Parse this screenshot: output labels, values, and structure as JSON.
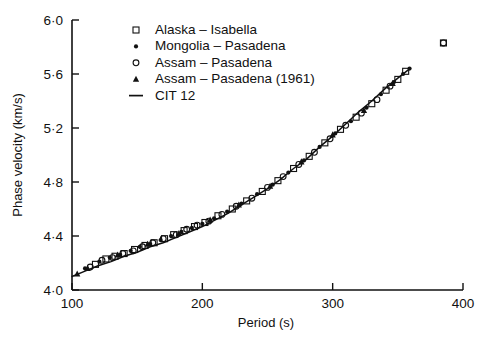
{
  "chart_data": {
    "type": "scatter",
    "title": "",
    "xlabel": "Period (s)",
    "ylabel": "Phase velocity (km/s)",
    "xlim": [
      100,
      400
    ],
    "ylim": [
      4.0,
      6.0
    ],
    "xticks": [
      100,
      200,
      300,
      400
    ],
    "xtick_labels": [
      "100",
      "200",
      "300",
      "400"
    ],
    "yticks": [
      4.0,
      4.4,
      4.8,
      5.2,
      5.6,
      6.0
    ],
    "ytick_labels": [
      "4·0",
      "4·4",
      "4·8",
      "5·2",
      "5·6",
      "6·0"
    ],
    "grid": false,
    "legend_position": "upper-left-inside",
    "legend": [
      {
        "label": "Alaska – Isabella",
        "marker": "open-square"
      },
      {
        "label": "Mongolia – Pasadena",
        "marker": "filled-dot"
      },
      {
        "label": "Assam – Pasadena",
        "marker": "open-circle"
      },
      {
        "label": "Assam – Pasadena (1961)",
        "marker": "filled-triangle"
      },
      {
        "label": "CIT 12",
        "marker": "line"
      }
    ],
    "series": [
      {
        "name": "Alaska – Isabella",
        "marker": "open-square",
        "points": [
          [
            118,
            4.19
          ],
          [
            126,
            4.23
          ],
          [
            133,
            4.25
          ],
          [
            140,
            4.27
          ],
          [
            148,
            4.3
          ],
          [
            156,
            4.33
          ],
          [
            163,
            4.35
          ],
          [
            171,
            4.38
          ],
          [
            178,
            4.41
          ],
          [
            186,
            4.44
          ],
          [
            194,
            4.47
          ],
          [
            202,
            4.5
          ],
          [
            212,
            4.55
          ],
          [
            223,
            4.6
          ],
          [
            234,
            4.66
          ],
          [
            246,
            4.73
          ],
          [
            258,
            4.81
          ],
          [
            270,
            4.9
          ],
          [
            282,
            4.99
          ],
          [
            294,
            5.09
          ],
          [
            306,
            5.19
          ],
          [
            318,
            5.28
          ],
          [
            330,
            5.38
          ],
          [
            341,
            5.48
          ],
          [
            350,
            5.56
          ],
          [
            356,
            5.62
          ],
          [
            385,
            5.83
          ]
        ]
      },
      {
        "name": "Mongolia – Pasadena",
        "marker": "filled-dot",
        "points": [
          [
            110,
            4.16
          ],
          [
            121,
            4.21
          ],
          [
            129,
            4.24
          ],
          [
            137,
            4.26
          ],
          [
            145,
            4.29
          ],
          [
            152,
            4.32
          ],
          [
            160,
            4.34
          ],
          [
            168,
            4.37
          ],
          [
            176,
            4.4
          ],
          [
            184,
            4.43
          ],
          [
            192,
            4.46
          ],
          [
            200,
            4.49
          ],
          [
            209,
            4.53
          ],
          [
            219,
            4.58
          ],
          [
            230,
            4.64
          ],
          [
            242,
            4.71
          ],
          [
            254,
            4.78
          ],
          [
            266,
            4.87
          ],
          [
            278,
            4.96
          ],
          [
            290,
            5.06
          ],
          [
            302,
            5.16
          ],
          [
            314,
            5.25
          ],
          [
            326,
            5.35
          ],
          [
            337,
            5.45
          ],
          [
            347,
            5.54
          ],
          [
            354,
            5.6
          ],
          [
            359,
            5.64
          ]
        ]
      },
      {
        "name": "Assam – Pasadena",
        "marker": "open-circle",
        "points": [
          [
            114,
            4.17
          ],
          [
            123,
            4.22
          ],
          [
            131,
            4.24
          ],
          [
            139,
            4.27
          ],
          [
            147,
            4.29
          ],
          [
            154,
            4.32
          ],
          [
            162,
            4.35
          ],
          [
            170,
            4.38
          ],
          [
            180,
            4.41
          ],
          [
            188,
            4.45
          ],
          [
            196,
            4.48
          ],
          [
            205,
            4.51
          ],
          [
            215,
            4.56
          ],
          [
            226,
            4.62
          ],
          [
            238,
            4.68
          ],
          [
            250,
            4.76
          ],
          [
            262,
            4.84
          ],
          [
            274,
            4.93
          ],
          [
            286,
            5.02
          ],
          [
            298,
            5.12
          ],
          [
            310,
            5.22
          ],
          [
            322,
            5.31
          ],
          [
            334,
            5.41
          ],
          [
            344,
            5.51
          ],
          [
            385,
            5.83
          ]
        ]
      },
      {
        "name": "Assam – Pasadena (1961)",
        "marker": "filled-triangle",
        "points": [
          [
            104,
            4.12
          ],
          [
            112,
            4.16
          ],
          [
            135,
            4.26
          ],
          [
            158,
            4.34
          ],
          [
            182,
            4.42
          ],
          [
            206,
            4.52
          ],
          [
            228,
            4.63
          ],
          [
            252,
            4.77
          ],
          [
            276,
            4.95
          ],
          [
            300,
            5.15
          ],
          [
            324,
            5.33
          ],
          [
            346,
            5.53
          ]
        ]
      }
    ],
    "fit_curve": {
      "name": "CIT 12",
      "points": [
        [
          100,
          4.1
        ],
        [
          110,
          4.14
        ],
        [
          120,
          4.18
        ],
        [
          130,
          4.21
        ],
        [
          140,
          4.25
        ],
        [
          150,
          4.28
        ],
        [
          160,
          4.32
        ],
        [
          170,
          4.35
        ],
        [
          180,
          4.39
        ],
        [
          190,
          4.43
        ],
        [
          200,
          4.47
        ],
        [
          210,
          4.52
        ],
        [
          220,
          4.57
        ],
        [
          230,
          4.63
        ],
        [
          240,
          4.69
        ],
        [
          250,
          4.75
        ],
        [
          260,
          4.82
        ],
        [
          270,
          4.9
        ],
        [
          280,
          4.97
        ],
        [
          290,
          5.06
        ],
        [
          300,
          5.14
        ],
        [
          310,
          5.23
        ],
        [
          320,
          5.32
        ],
        [
          330,
          5.4
        ],
        [
          340,
          5.49
        ],
        [
          350,
          5.57
        ],
        [
          358,
          5.63
        ]
      ]
    }
  }
}
